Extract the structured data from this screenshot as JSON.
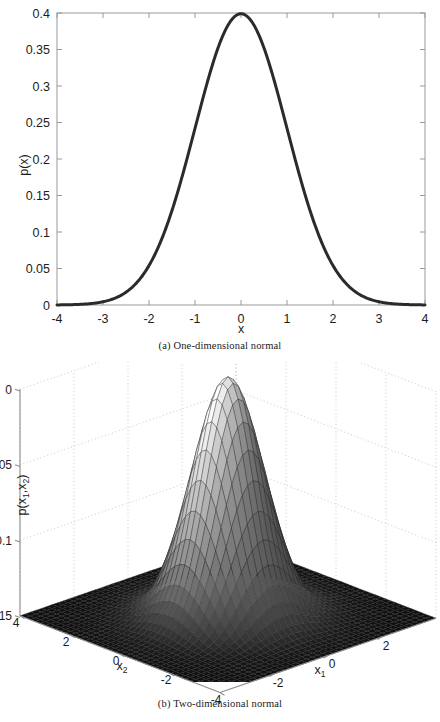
{
  "figure": {
    "panels": [
      {
        "id": "a",
        "caption": "(a) One-dimensional normal",
        "kind": "2d-line"
      },
      {
        "id": "b",
        "caption": "(b) Two-dimensional normal",
        "kind": "3d-mesh-surface"
      }
    ]
  },
  "chart_data": [
    {
      "type": "line",
      "id": "one-dimensional-normal",
      "title": "",
      "caption": "(a) One-dimensional normal",
      "xlabel": "x",
      "ylabel": "p(x)",
      "xlim": [
        -4,
        4
      ],
      "ylim": [
        0,
        0.4
      ],
      "grid": false,
      "legend": null,
      "line_color": "#2b2b2b",
      "line_width": 3,
      "xticks": [
        -4,
        -3,
        -2,
        -1,
        0,
        1,
        2,
        3,
        4
      ],
      "xtick_labels": [
        "-4",
        "-3",
        "-2",
        "-1",
        "0",
        "1",
        "2",
        "3",
        "4"
      ],
      "yticks": [
        0,
        0.05,
        0.1,
        0.15,
        0.2,
        0.25,
        0.3,
        0.35,
        0.4
      ],
      "ytick_labels": [
        "0",
        "0.05",
        "0.1",
        "0.15",
        "0.2",
        "0.25",
        "0.3",
        "0.35",
        "0.4"
      ],
      "function": "standard normal pdf, mean 0, sigma 1",
      "x": [
        -4,
        -3.75,
        -3.5,
        -3.25,
        -3,
        -2.75,
        -2.5,
        -2.25,
        -2,
        -1.75,
        -1.5,
        -1.25,
        -1,
        -0.75,
        -0.5,
        -0.25,
        0,
        0.25,
        0.5,
        0.75,
        1,
        1.25,
        1.5,
        1.75,
        2,
        2.25,
        2.5,
        2.75,
        3,
        3.25,
        3.5,
        3.75,
        4
      ],
      "values": [
        0.0001,
        0.0004,
        0.0009,
        0.002,
        0.0044,
        0.0091,
        0.0175,
        0.0317,
        0.054,
        0.0863,
        0.1295,
        0.1826,
        0.242,
        0.3011,
        0.3521,
        0.3867,
        0.3989,
        0.3867,
        0.3521,
        0.3011,
        0.242,
        0.1826,
        0.1295,
        0.0863,
        0.054,
        0.0317,
        0.0175,
        0.0091,
        0.0044,
        0.002,
        0.0009,
        0.0004,
        0.0001
      ],
      "peak": {
        "x": 0,
        "y": 0.3989
      }
    },
    {
      "type": "surface",
      "id": "two-dimensional-normal",
      "title": "",
      "caption": "(b) Two-dimensional normal",
      "xlabel": "x_1",
      "ylabel": "x_2",
      "zlabel": "p(x_1,x_2)",
      "xlim": [
        -4,
        4
      ],
      "ylim": [
        -4,
        4
      ],
      "zlim": [
        0,
        0.15
      ],
      "grid": true,
      "grid_style": "dotted",
      "mesh": true,
      "colormap": "gray",
      "xticks": [
        -2,
        0,
        2
      ],
      "xtick_labels": [
        "-2",
        "0",
        "2"
      ],
      "yticks": [
        4,
        2,
        0,
        -2,
        -4
      ],
      "ytick_labels": [
        "4",
        "2",
        "0",
        "-2",
        "-4"
      ],
      "zticks": [
        0,
        0.05,
        0.1,
        0.15
      ],
      "ztick_labels": [
        "0",
        "0.05",
        "0.1",
        "0.15"
      ],
      "function": "bivariate standard normal pdf, mean (0,0), identity covariance",
      "peak": {
        "x1": 0,
        "x2": 0,
        "z": 0.1592
      }
    }
  ],
  "labels": {
    "panel_a": {
      "ylabel": "p(x)",
      "xlabel": "x",
      "ytick_labels": [
        "0.4",
        "0.35",
        "0.3",
        "0.25",
        "0.2",
        "0.15",
        "0.1",
        "0.05",
        "0"
      ],
      "xtick_labels": [
        "-4",
        "-3",
        "-2",
        "-1",
        "0",
        "1",
        "2",
        "3",
        "4"
      ]
    },
    "panel_b": {
      "zlabel_main": "p(x",
      "zlabel_sub1": "1",
      "zlabel_mid": ",x",
      "zlabel_sub2": "2",
      "zlabel_end": ")",
      "xlabel_main": "x",
      "xlabel_sub": "1",
      "ylabel_main": "x",
      "ylabel_sub": "2",
      "ztick_labels": [
        "0.15",
        "0.1",
        "0.05",
        "0"
      ],
      "x1tick_labels": [
        "-2",
        "0",
        "2"
      ],
      "x2tick_labels": [
        "4",
        "2",
        "0",
        "-2",
        "-4"
      ]
    }
  },
  "colors": {
    "curve": "#2b2b2b",
    "axis": "#808080",
    "text": "#1c1c1c",
    "grid": "#b9b9b9",
    "surface_dark": "#111111",
    "surface_light": "#f2f2f2",
    "background": "#ffffff"
  }
}
